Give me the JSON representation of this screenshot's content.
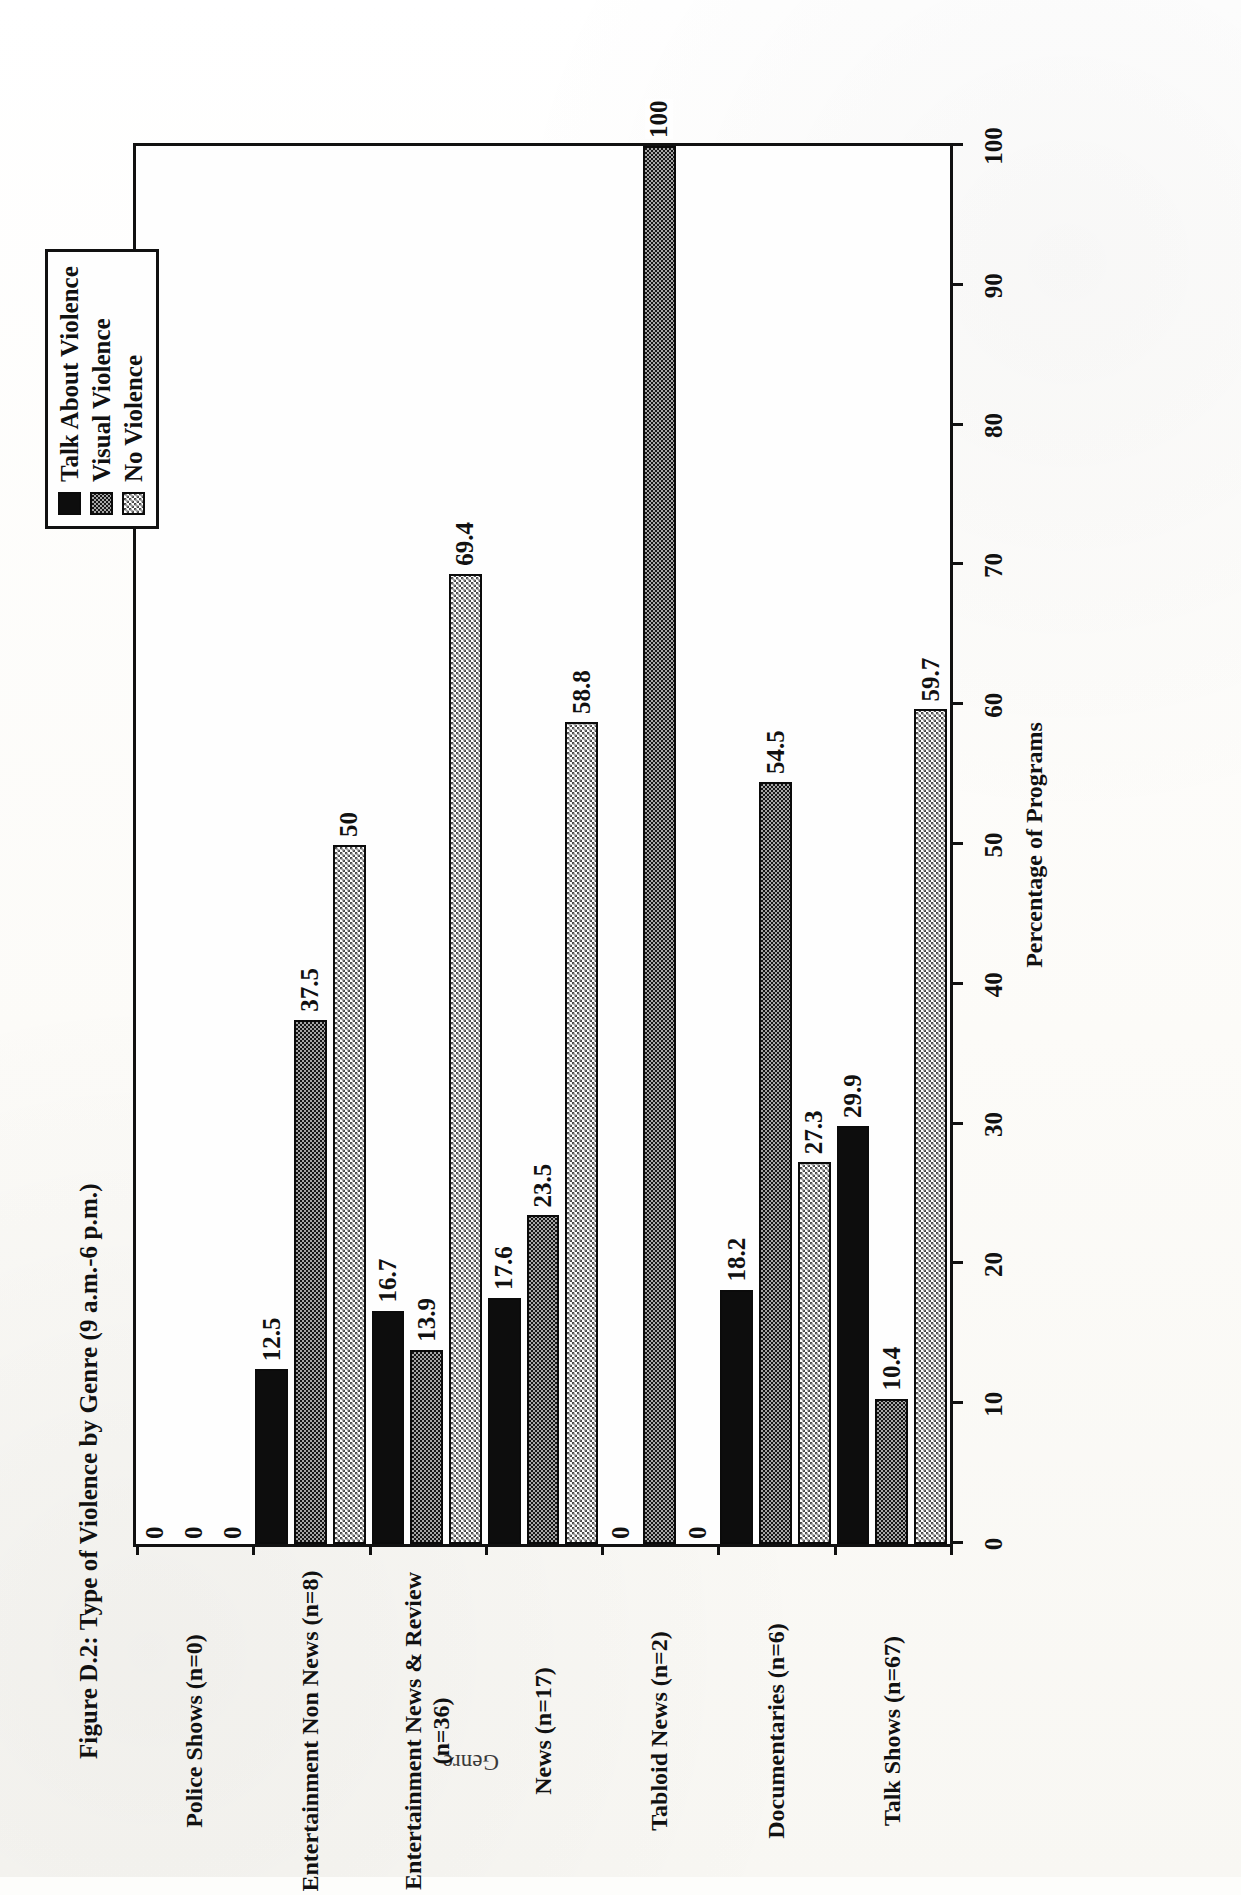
{
  "figure": {
    "title": "Figure D.2: Type of Violence by Genre (9 a.m.-6 p.m.)",
    "category_axis_title": "Genre",
    "value_axis_title": "Percentage of Programs"
  },
  "legend": {
    "items": [
      {
        "label": "Talk About Violence",
        "pattern": "solid-black",
        "swatch": "fill-solid"
      },
      {
        "label": "Visual Violence",
        "pattern": "dark-crosshatch",
        "swatch": "fill-dark-hatch"
      },
      {
        "label": "No Violence",
        "pattern": "light-checker",
        "swatch": "fill-light-check"
      }
    ]
  },
  "chart_data": {
    "type": "bar",
    "title": "Figure D.2: Type of Violence by Genre (9 a.m.-6 p.m.)",
    "xlabel": "Percentage of Programs",
    "ylabel": "Genre",
    "orientation": "horizontal",
    "xlim": [
      0,
      100
    ],
    "xticks": [
      0,
      10,
      20,
      30,
      40,
      50,
      60,
      70,
      80,
      90,
      100
    ],
    "grid": false,
    "legend_position": "top-right",
    "categories": [
      "Police Shows (n=0)",
      "Entertainment Non News (n=8)",
      "Entertainment News & Review\n(n=36)",
      "News (n=17)",
      "Tabloid News (n=2)",
      "Documentaries (n=6)",
      "Talk Shows (n=67)"
    ],
    "series": [
      {
        "name": "Talk About Violence",
        "values": [
          0,
          12.5,
          16.7,
          17.6,
          0,
          18.2,
          29.9
        ],
        "labels": [
          "0",
          "12.5",
          "16.7",
          "17.6",
          "0",
          "18.2",
          "29.9"
        ]
      },
      {
        "name": "Visual Violence",
        "values": [
          0,
          37.5,
          13.9,
          23.5,
          100,
          54.5,
          10.4
        ],
        "labels": [
          "0",
          "37.5",
          "13.9",
          "23.5",
          "100",
          "54.5",
          "10.4"
        ]
      },
      {
        "name": "No Violence",
        "values": [
          0,
          50,
          69.4,
          58.8,
          0,
          27.3,
          59.7
        ],
        "labels": [
          "0",
          "50",
          "69.4",
          "58.8",
          "0",
          "27.3",
          "59.7"
        ]
      }
    ]
  },
  "colors": {
    "ink": "#111111",
    "paper": "#fefefe",
    "series_solid": "#0d0d0d",
    "series_hatch": "#151515",
    "series_check": "#4a4a4a"
  }
}
